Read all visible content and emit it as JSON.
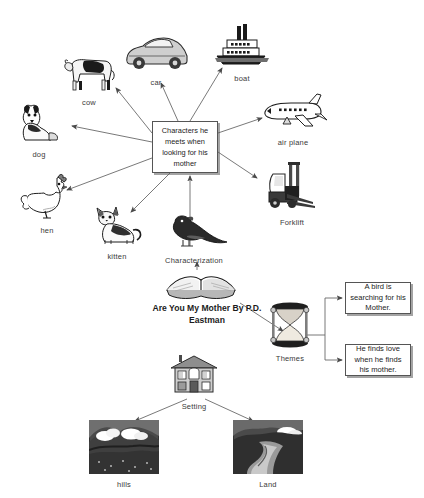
{
  "diagram": {
    "title_block": "Are You My Mother By P.D. Eastman",
    "central_node": "Characters he meets when looking for his mother",
    "characterization_label": "Characterization",
    "themes_label": "Themes",
    "setting_label": "Setting"
  },
  "characters": [
    {
      "id": "car",
      "label": "car",
      "icon": "car-icon"
    },
    {
      "id": "cow",
      "label": "cow",
      "icon": "cow-icon"
    },
    {
      "id": "boat",
      "label": "boat",
      "icon": "boat-icon"
    },
    {
      "id": "dog",
      "label": "dog",
      "icon": "dog-icon"
    },
    {
      "id": "airplane",
      "label": "air plane",
      "icon": "airplane-icon"
    },
    {
      "id": "hen",
      "label": "hen",
      "icon": "hen-icon"
    },
    {
      "id": "forklift",
      "label": "Forklift",
      "icon": "forklift-icon"
    },
    {
      "id": "kitten",
      "label": "kitten",
      "icon": "kitten-icon"
    }
  ],
  "themes": [
    {
      "id": "theme-1",
      "text": "A bird is searching for his  Mother."
    },
    {
      "id": "theme-2",
      "text": "He finds love when he finds his mother."
    }
  ],
  "settings": [
    {
      "id": "hills",
      "label": "hills",
      "icon": "hills-icon"
    },
    {
      "id": "land",
      "label": "Land",
      "icon": "land-icon"
    }
  ],
  "icons": {
    "book": "open-book-icon",
    "bird": "bird-icon",
    "house": "house-icon",
    "hourglass": "hourglass-icon"
  },
  "colors": {
    "background": "#ffffff",
    "line": "#4a4a4a",
    "box_border": "#555555",
    "text": "#1d1d1d"
  }
}
